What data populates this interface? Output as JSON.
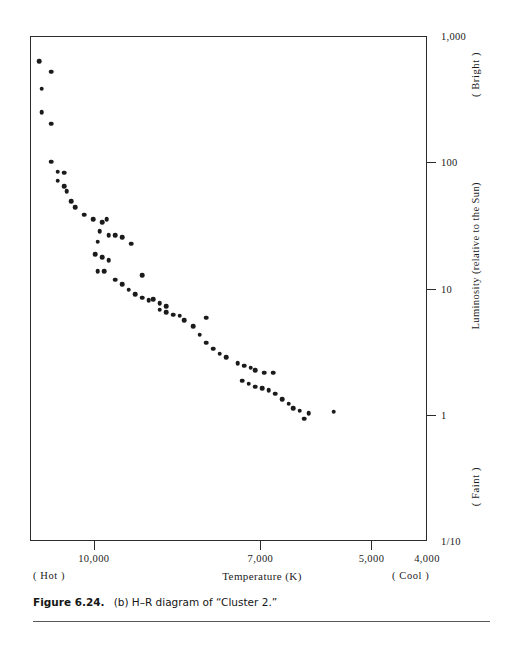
{
  "figure": {
    "caption_number": "Figure 6.24.",
    "caption_text": "(b) H–R diagram of “Cluster 2.”"
  },
  "axes": {
    "x_title": "Temperature (K)",
    "x_left_annotation": "( Hot )",
    "x_right_annotation": "( Cool )",
    "y_title": "Luminosity (relative to the Sun)",
    "y_top_annotation": "( Bright )",
    "y_bottom_annotation": "( Faint )"
  },
  "chart_data": {
    "type": "scatter",
    "title": "(b) H–R diagram of “Cluster 2.”",
    "xlabel": "Temperature (K)",
    "ylabel": "Luminosity (relative to the Sun)",
    "xscale": "linear-reversed",
    "yscale": "log",
    "xlim": [
      11150,
      4000
    ],
    "ylim": [
      0.1,
      1000
    ],
    "grid": false,
    "legend": null,
    "x_ticks": [
      {
        "value": 10000,
        "label": "10,000"
      },
      {
        "value": 7000,
        "label": "7,000"
      },
      {
        "value": 5000,
        "label": "5,000"
      },
      {
        "value": 4000,
        "label": "4,000"
      }
    ],
    "y_ticks": [
      {
        "value": 1000,
        "label": "1,000"
      },
      {
        "value": 100,
        "label": "100"
      },
      {
        "value": 10,
        "label": "10"
      },
      {
        "value": 1,
        "label": "1"
      },
      {
        "value": 0.1,
        "label": "1/10"
      }
    ],
    "point_count": 69,
    "points": [
      {
        "x": 10790,
        "y": 530
      },
      {
        "x": 11000,
        "y": 640
      },
      {
        "x": 10960,
        "y": 390
      },
      {
        "x": 10790,
        "y": 205
      },
      {
        "x": 10960,
        "y": 255
      },
      {
        "x": 10790,
        "y": 103
      },
      {
        "x": 10670,
        "y": 86
      },
      {
        "x": 10670,
        "y": 73
      },
      {
        "x": 10550,
        "y": 84
      },
      {
        "x": 10550,
        "y": 66
      },
      {
        "x": 10510,
        "y": 60
      },
      {
        "x": 10430,
        "y": 50
      },
      {
        "x": 10350,
        "y": 45
      },
      {
        "x": 10190,
        "y": 39
      },
      {
        "x": 10030,
        "y": 36
      },
      {
        "x": 9870,
        "y": 34
      },
      {
        "x": 9790,
        "y": 36
      },
      {
        "x": 9910,
        "y": 29
      },
      {
        "x": 9750,
        "y": 27
      },
      {
        "x": 9630,
        "y": 27
      },
      {
        "x": 9510,
        "y": 26
      },
      {
        "x": 9950,
        "y": 24
      },
      {
        "x": 9350,
        "y": 23
      },
      {
        "x": 9990,
        "y": 19
      },
      {
        "x": 9870,
        "y": 18
      },
      {
        "x": 9750,
        "y": 17
      },
      {
        "x": 9950,
        "y": 14
      },
      {
        "x": 9830,
        "y": 14
      },
      {
        "x": 9150,
        "y": 13
      },
      {
        "x": 9630,
        "y": 12
      },
      {
        "x": 9510,
        "y": 11
      },
      {
        "x": 9390,
        "y": 10
      },
      {
        "x": 9270,
        "y": 9.2
      },
      {
        "x": 9150,
        "y": 8.6
      },
      {
        "x": 9030,
        "y": 8.2
      },
      {
        "x": 8950,
        "y": 8.4
      },
      {
        "x": 8830,
        "y": 7.8
      },
      {
        "x": 8710,
        "y": 7.4
      },
      {
        "x": 8830,
        "y": 6.9
      },
      {
        "x": 8710,
        "y": 6.6
      },
      {
        "x": 8590,
        "y": 6.3
      },
      {
        "x": 8470,
        "y": 6.2
      },
      {
        "x": 8390,
        "y": 5.7
      },
      {
        "x": 8230,
        "y": 5.1
      },
      {
        "x": 7990,
        "y": 6.0
      },
      {
        "x": 8110,
        "y": 4.4
      },
      {
        "x": 7990,
        "y": 3.8
      },
      {
        "x": 7870,
        "y": 3.4
      },
      {
        "x": 7750,
        "y": 3.1
      },
      {
        "x": 7630,
        "y": 2.9
      },
      {
        "x": 7430,
        "y": 2.6
      },
      {
        "x": 7310,
        "y": 2.5
      },
      {
        "x": 7190,
        "y": 2.4
      },
      {
        "x": 7110,
        "y": 2.3
      },
      {
        "x": 6950,
        "y": 2.2
      },
      {
        "x": 6790,
        "y": 2.2
      },
      {
        "x": 7350,
        "y": 1.9
      },
      {
        "x": 7230,
        "y": 1.8
      },
      {
        "x": 7110,
        "y": 1.7
      },
      {
        "x": 6990,
        "y": 1.65
      },
      {
        "x": 6870,
        "y": 1.6
      },
      {
        "x": 6750,
        "y": 1.5
      },
      {
        "x": 6630,
        "y": 1.35
      },
      {
        "x": 6510,
        "y": 1.25
      },
      {
        "x": 6430,
        "y": 1.15
      },
      {
        "x": 6310,
        "y": 1.1
      },
      {
        "x": 6230,
        "y": 0.95
      },
      {
        "x": 6150,
        "y": 1.05
      },
      {
        "x": 5700,
        "y": 1.08
      }
    ]
  }
}
